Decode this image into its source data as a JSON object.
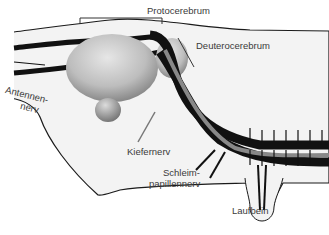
{
  "diagram": {
    "type": "anatomical-cross-section",
    "colors": {
      "background": "#ffffff",
      "body_fill": "#f3f3f3",
      "outline": "#1a1a1a",
      "nerve": "#111111",
      "ganglion_light": "#d6d6d6",
      "ganglion_dark": "#8a8a8a",
      "label_text": "#3a3a3a"
    },
    "labels": {
      "protocerebrum": "Protocerebrum",
      "deuterocerebrum": "Deuterocerebrum",
      "antennennerv_line1": "Antennen-",
      "antennennerv_line2": "nerv",
      "kiefernerv": "Kiefernerv",
      "schleimpapillennerv_line1": "Schleim-",
      "schleimpapillennerv_line2": "papillennerv",
      "laufbein": "Laufbein"
    }
  }
}
